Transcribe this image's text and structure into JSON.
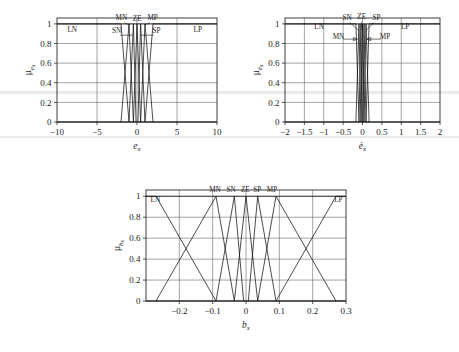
{
  "figure": {
    "title": "",
    "background": "#ffffff",
    "line_color": "#111111",
    "grid_color": "#5a5a5a"
  },
  "charts": [
    {
      "id": "chart-ex",
      "position": {
        "x": 14,
        "y": 6,
        "w": 215,
        "h": 160
      },
      "plot_box": {
        "x": 57,
        "y": 18,
        "w": 160,
        "h": 104
      },
      "chart_data": {
        "type": "line",
        "title": "",
        "xlabel": "e_x",
        "ylabel": "μ_{e_x}",
        "xlim": [
          -10,
          10
        ],
        "ylim": [
          0,
          1.06
        ],
        "grid": true,
        "legend_position": "inside-annotations",
        "xticks": [
          -10,
          -5,
          0,
          5,
          10
        ],
        "xticklabels": [
          "−10",
          "−5",
          "0",
          "5",
          "10"
        ],
        "yticks": [
          0,
          0.2,
          0.4,
          0.6,
          0.8,
          1
        ],
        "yticklabels": [
          "0",
          "0.2",
          "0.4",
          "0.6",
          "0.8",
          "1"
        ],
        "series": [
          {
            "name": "LN",
            "shape": "trapezoid-left",
            "x": [
              -10,
              -2.0,
              -1.0
            ],
            "y": [
              1,
              1,
              0
            ]
          },
          {
            "name": "MN",
            "shape": "triangle",
            "x": [
              -2.0,
              -1.0,
              -0.45
            ],
            "y": [
              0,
              1,
              0
            ]
          },
          {
            "name": "SN",
            "shape": "triangle",
            "x": [
              -1.0,
              -0.45,
              -0.12
            ],
            "y": [
              0,
              1,
              0
            ]
          },
          {
            "name": "ZE",
            "shape": "triangle",
            "x": [
              -0.45,
              0,
              0.45
            ],
            "y": [
              0,
              1,
              0
            ]
          },
          {
            "name": "SP",
            "shape": "triangle",
            "x": [
              0.12,
              0.45,
              1.0
            ],
            "y": [
              0,
              1,
              0
            ]
          },
          {
            "name": "MP",
            "shape": "triangle",
            "x": [
              0.45,
              1.0,
              2.0
            ],
            "y": [
              0,
              1,
              0
            ]
          },
          {
            "name": "LP",
            "shape": "trapezoid-right",
            "x": [
              1.0,
              2.0,
              10
            ],
            "y": [
              0,
              1,
              1
            ]
          }
        ],
        "annotations": [
          {
            "text": "LN",
            "x": -8.1,
            "y": 0.915
          },
          {
            "text": "MN",
            "x": -1.95,
            "y": 1.035
          },
          {
            "text": "ZE",
            "x": 0.02,
            "y": 1.03
          },
          {
            "text": "MP",
            "x": 1.95,
            "y": 1.035
          },
          {
            "text": "SN",
            "x": -2.55,
            "y": 0.905
          },
          {
            "text": "SP",
            "x": 2.45,
            "y": 0.905
          },
          {
            "text": "LP",
            "x": 7.6,
            "y": 0.915
          }
        ]
      }
    },
    {
      "id": "chart-edot",
      "position": {
        "x": 248,
        "y": 6,
        "w": 205,
        "h": 160
      },
      "plot_box": {
        "x": 285,
        "y": 18,
        "w": 155,
        "h": 104
      },
      "chart_data": {
        "type": "line",
        "title": "",
        "xlabel": "ė_x",
        "ylabel": "μ_{ė_x}",
        "xlim": [
          -2,
          2
        ],
        "ylim": [
          0,
          1.06
        ],
        "grid": true,
        "legend_position": "inside-annotations",
        "xticks": [
          -2,
          -1.5,
          -1,
          -0.5,
          0,
          0.5,
          1,
          1.5,
          2
        ],
        "xticklabels": [
          "−2",
          "−1.5",
          "−1",
          "−0.5",
          "0",
          "0.5",
          "1",
          "1.5",
          "2"
        ],
        "yticks": [
          0,
          0.2,
          0.4,
          0.6,
          0.8,
          1
        ],
        "yticklabels": [
          "0",
          "0.2",
          "0.4",
          "0.6",
          "0.8",
          "1"
        ],
        "series": [
          {
            "name": "LN",
            "shape": "trapezoid-left",
            "x": [
              -2,
              -0.17,
              -0.09
            ],
            "y": [
              1,
              1,
              0
            ]
          },
          {
            "name": "MN",
            "shape": "triangle",
            "x": [
              -0.17,
              -0.09,
              -0.04
            ],
            "y": [
              0,
              1,
              0
            ]
          },
          {
            "name": "SN",
            "shape": "triangle",
            "x": [
              -0.09,
              -0.04,
              -0.01
            ],
            "y": [
              0,
              1,
              0
            ]
          },
          {
            "name": "ZE",
            "shape": "triangle",
            "x": [
              -0.04,
              0,
              0.04
            ],
            "y": [
              0,
              1,
              0
            ]
          },
          {
            "name": "SP",
            "shape": "triangle",
            "x": [
              0.01,
              0.04,
              0.09
            ],
            "y": [
              0,
              1,
              0
            ]
          },
          {
            "name": "MP",
            "shape": "triangle",
            "x": [
              0.04,
              0.09,
              0.17
            ],
            "y": [
              0,
              1,
              0
            ]
          },
          {
            "name": "LP",
            "shape": "trapezoid-right",
            "x": [
              0.09,
              0.17,
              2
            ],
            "y": [
              0,
              1,
              1
            ]
          }
        ],
        "annotations": [
          {
            "text": "LN",
            "x": -1.12,
            "y": 0.945
          },
          {
            "text": "LP",
            "x": 1.1,
            "y": 0.945
          },
          {
            "text": "SN",
            "x": -0.4,
            "y": 1.04
          },
          {
            "text": "ZE",
            "x": -0.02,
            "y": 1.045
          },
          {
            "text": "SP",
            "x": 0.36,
            "y": 1.04
          },
          {
            "text": "MN",
            "x": -0.62,
            "y": 0.845
          },
          {
            "text": "MP",
            "x": 0.58,
            "y": 0.845
          }
        ]
      }
    },
    {
      "id": "chart-bx",
      "position": {
        "x": 100,
        "y": 176,
        "w": 320,
        "h": 172
      },
      "plot_box": {
        "x": 146,
        "y": 190,
        "w": 200,
        "h": 111
      },
      "chart_data": {
        "type": "line",
        "title": "",
        "xlabel": "b_x",
        "ylabel": "μ_{b_x}",
        "xlim": [
          -0.3,
          0.3
        ],
        "ylim": [
          0,
          1.06
        ],
        "grid": true,
        "legend_position": "inside-annotations",
        "xticks": [
          -0.2,
          -0.1,
          0,
          0.1,
          0.2,
          0.3
        ],
        "xticklabels": [
          "−0.2",
          "−0.1",
          "0",
          "0.1",
          "0.2",
          "0.3"
        ],
        "yticks": [
          0,
          0.2,
          0.4,
          0.6,
          0.8,
          1
        ],
        "yticklabels": [
          "0",
          "0.2",
          "0.4",
          "0.6",
          "0.8",
          "1"
        ],
        "series": [
          {
            "name": "LN",
            "shape": "trapezoid-left",
            "x": [
              -0.3,
              -0.27,
              -0.09
            ],
            "y": [
              1,
              1,
              0
            ]
          },
          {
            "name": "MN",
            "shape": "triangle",
            "x": [
              -0.27,
              -0.09,
              -0.035
            ],
            "y": [
              0,
              1,
              0
            ]
          },
          {
            "name": "SN",
            "shape": "triangle",
            "x": [
              -0.09,
              -0.035,
              -0.007
            ],
            "y": [
              0,
              1,
              0
            ]
          },
          {
            "name": "ZE",
            "shape": "triangle",
            "x": [
              -0.035,
              0,
              0.035
            ],
            "y": [
              0,
              1,
              0
            ]
          },
          {
            "name": "SP",
            "shape": "triangle",
            "x": [
              0.007,
              0.035,
              0.09
            ],
            "y": [
              0,
              1,
              0
            ]
          },
          {
            "name": "MP",
            "shape": "triangle",
            "x": [
              0.035,
              0.09,
              0.27
            ],
            "y": [
              0,
              1,
              0
            ]
          },
          {
            "name": "LP",
            "shape": "trapezoid-right",
            "x": [
              0.09,
              0.27,
              0.3
            ],
            "y": [
              0,
              1,
              1
            ]
          }
        ],
        "annotations": [
          {
            "text": "LN",
            "x": -0.272,
            "y": 0.945
          },
          {
            "text": "MN",
            "x": -0.093,
            "y": 1.04
          },
          {
            "text": "SN",
            "x": -0.045,
            "y": 1.04
          },
          {
            "text": "ZE",
            "x": -0.002,
            "y": 1.04
          },
          {
            "text": "SP",
            "x": 0.034,
            "y": 1.04
          },
          {
            "text": "MP",
            "x": 0.078,
            "y": 1.04
          },
          {
            "text": "LP",
            "x": 0.277,
            "y": 0.945
          }
        ]
      }
    }
  ]
}
